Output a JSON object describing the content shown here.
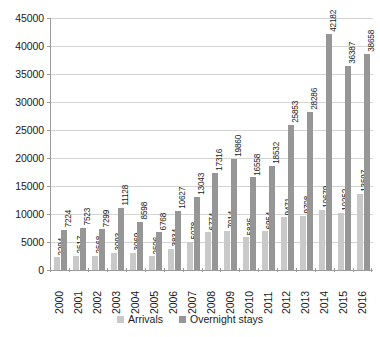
{
  "chart_data": {
    "type": "bar",
    "title": "",
    "subtitle": "",
    "xlabel": "",
    "ylabel": "",
    "ylim": [
      0,
      45000
    ],
    "ytick_step": 5000,
    "yticks": [
      0,
      5000,
      10000,
      15000,
      20000,
      25000,
      30000,
      35000,
      40000,
      45000
    ],
    "ytick_labels": [
      "0",
      "5000",
      "10000",
      "15000",
      "20000",
      "25000",
      "30000",
      "35000",
      "40000",
      "45000"
    ],
    "grid": true,
    "grid_axis": "y",
    "legend_position": "bottom",
    "categories": [
      "2000",
      "2001",
      "2002",
      "2003",
      "2004",
      "2005",
      "2006",
      "2007",
      "2008",
      "2009",
      "2010",
      "2011",
      "2012",
      "2013",
      "2014",
      "2015",
      "2016"
    ],
    "series": [
      {
        "name": "Arrivals",
        "color": "#c9c9c9",
        "values": [
          2294,
          2517,
          2568,
          3093,
          3069,
          2506,
          3834,
          5078,
          6774,
          7014,
          5835,
          6954,
          9471,
          9708,
          10679,
          10252,
          13597
        ]
      },
      {
        "name": "Overnight stays",
        "color": "#969696",
        "values": [
          7224,
          7523,
          7299,
          11128,
          8598,
          6768,
          10627,
          13043,
          17316,
          19860,
          16558,
          18532,
          25853,
          28286,
          42182,
          36387,
          38658
        ]
      }
    ],
    "data_labels": true,
    "data_label_rotation": 90
  },
  "colors": {
    "arrivals": "#c9c9c9",
    "overnight": "#969696",
    "gridline": "#d4d4d4",
    "axis": "#9b9b9b",
    "text": "#1a1a1a",
    "background": "#ffffff"
  },
  "legend": {
    "items": [
      {
        "label": "Arrivals",
        "color": "#c9c9c9"
      },
      {
        "label": "Overnight stays",
        "color": "#969696"
      }
    ]
  }
}
